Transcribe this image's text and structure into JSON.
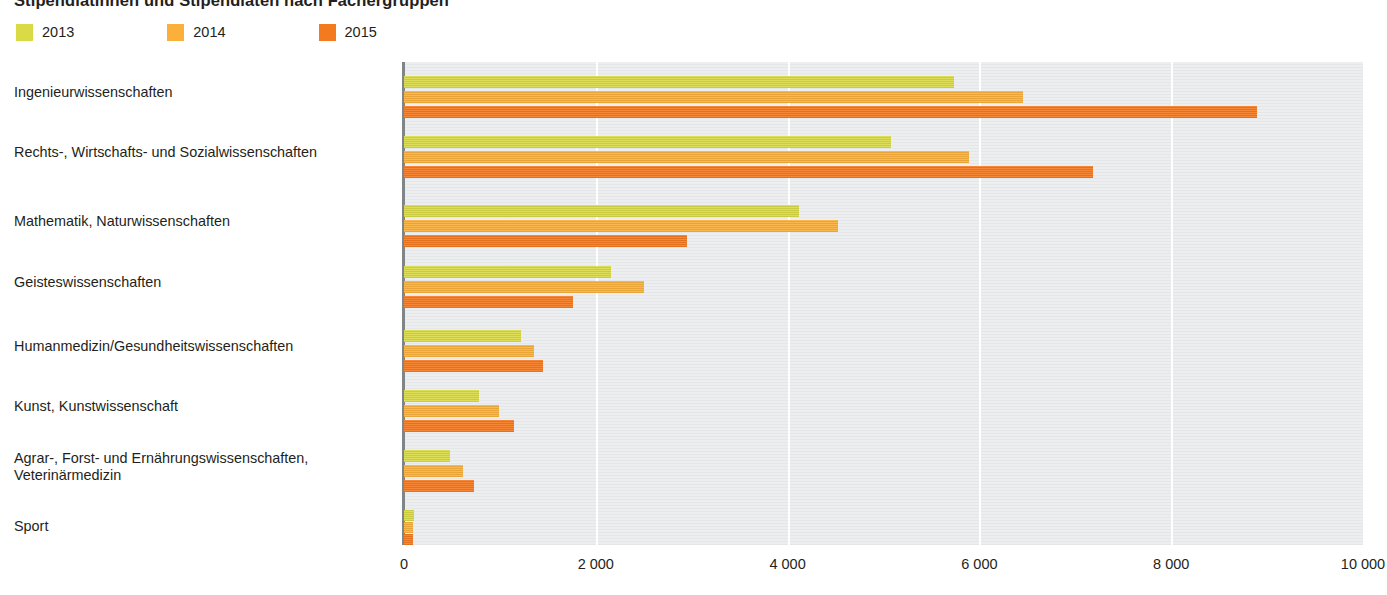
{
  "title": "Stipendiatinnen und Stipendiaten nach Fächergruppen",
  "legend": {
    "items": [
      {
        "label": "2013",
        "color": "#d9da45"
      },
      {
        "label": "2014",
        "color": "#fbb03b"
      },
      {
        "label": "2015",
        "color": "#f47a20"
      }
    ]
  },
  "axis": {
    "ticks": [
      "0",
      "2 000",
      "4 000",
      "6 000",
      "8 000",
      "10 000"
    ],
    "tick_values": [
      0,
      2000,
      4000,
      6000,
      8000,
      10000
    ],
    "min": 0,
    "max": 10000
  },
  "chart_data": {
    "type": "bar",
    "orientation": "horizontal",
    "title": "Stipendiatinnen und Stipendiaten nach Fächergruppen",
    "xlabel": "",
    "ylabel": "",
    "xlim": [
      0,
      10000
    ],
    "grid": true,
    "legend_position": "top-left",
    "categories": [
      "Ingenieurwissenschaften",
      "Rechts-, Wirtschafts- und  Sozialwissenschaften",
      "Mathematik, Naturwissenschaften",
      "Geisteswissenschaften",
      "Humanmedizin/Gesundheitswissenschaften",
      "Kunst, Kunstwissenschaft",
      "Agrar-, Forst- und Ernährungswissenschaften, Veterinärmedizin",
      "Sport"
    ],
    "series": [
      {
        "name": "2013",
        "color": "#d9da45",
        "values": [
          5730,
          5080,
          4120,
          2160,
          1220,
          780,
          480,
          100
        ]
      },
      {
        "name": "2014",
        "color": "#fbb03b",
        "values": [
          6450,
          5890,
          4530,
          2500,
          1360,
          990,
          620,
          90
        ]
      },
      {
        "name": "2015",
        "color": "#f47a20",
        "values": [
          8890,
          7180,
          2950,
          1760,
          1450,
          1150,
          730,
          95
        ]
      }
    ]
  },
  "layout": {
    "rows": [
      {
        "label_lines": [
          "Ingenieurwissenschaften"
        ],
        "label_top": 84,
        "bar_tops": [
          76,
          91,
          106
        ]
      },
      {
        "label_lines": [
          "Rechts-, Wirtschafts- und  Sozialwissenschaften"
        ],
        "label_top": 144,
        "bar_tops": [
          136,
          151,
          166
        ]
      },
      {
        "label_lines": [
          "Mathematik, Naturwissenschaften"
        ],
        "label_top": 213,
        "bar_tops": [
          205,
          220,
          235
        ]
      },
      {
        "label_lines": [
          "Geisteswissenschaften"
        ],
        "label_top": 274,
        "bar_tops": [
          266,
          281,
          296
        ]
      },
      {
        "label_lines": [
          "Humanmedizin/Gesundheitswissenschaften"
        ],
        "label_top": 338,
        "bar_tops": [
          330,
          345,
          360
        ]
      },
      {
        "label_lines": [
          "Kunst, Kunstwissenschaft"
        ],
        "label_top": 398,
        "bar_tops": [
          390,
          405,
          420
        ]
      },
      {
        "label_lines": [
          "Agrar-, Forst- und Ernährungswissenschaften,",
          "Veterinärmedizin"
        ],
        "label_top": 450,
        "bar_tops": [
          450,
          465,
          480
        ]
      },
      {
        "label_lines": [
          "Sport"
        ],
        "label_top": 518,
        "bar_tops": [
          510,
          522,
          534
        ]
      }
    ]
  }
}
